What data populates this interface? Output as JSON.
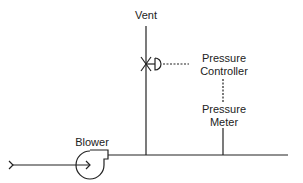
{
  "diagram": {
    "type": "process-flow-schematic",
    "labels": {
      "vent": "Vent",
      "pressure_controller_line1": "Pressure",
      "pressure_controller_line2": "Controller",
      "pressure_meter_line1": "Pressure",
      "pressure_meter_line2": "Meter",
      "blower": "Blower"
    },
    "nodes": [
      {
        "id": "inlet",
        "label": "",
        "icon": "inlet-arrow-icon"
      },
      {
        "id": "blower",
        "label": "Blower",
        "icon": "blower-icon"
      },
      {
        "id": "vent-valve",
        "label": "",
        "icon": "valve-icon"
      },
      {
        "id": "vent",
        "label": "Vent"
      },
      {
        "id": "pressure-controller",
        "label": "Pressure Controller"
      },
      {
        "id": "pressure-meter",
        "label": "Pressure Meter"
      }
    ],
    "edges": [
      {
        "from": "inlet",
        "to": "blower",
        "style": "solid"
      },
      {
        "from": "blower",
        "to": "main-line",
        "style": "solid"
      },
      {
        "from": "main-line",
        "to": "vent-valve",
        "style": "solid"
      },
      {
        "from": "vent-valve",
        "to": "vent",
        "style": "solid"
      },
      {
        "from": "pressure-controller",
        "to": "vent-valve",
        "style": "dashed"
      },
      {
        "from": "pressure-meter",
        "to": "pressure-controller",
        "style": "dashed"
      },
      {
        "from": "main-line",
        "to": "pressure-meter",
        "style": "solid"
      }
    ],
    "colors": {
      "line": "#222222",
      "background": "#ffffff"
    }
  }
}
